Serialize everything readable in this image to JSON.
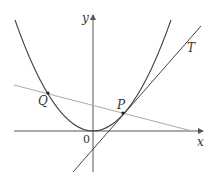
{
  "diagram": {
    "labels": {
      "y_axis": "y",
      "x_axis": "x",
      "origin": "0",
      "point_p": "P",
      "point_q": "Q",
      "tangent": "T"
    },
    "colors": {
      "curve": "#444444",
      "tangent": "#444444",
      "secant": "#aaaaaa",
      "axes": "#555555"
    }
  }
}
